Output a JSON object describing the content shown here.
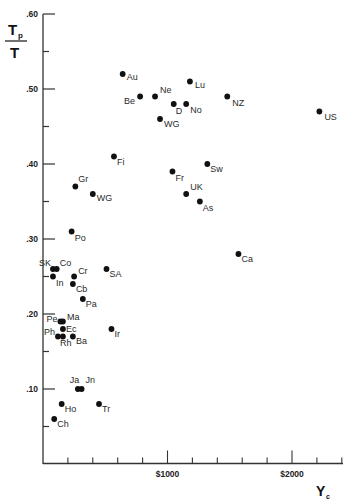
{
  "chart_data": {
    "type": "scatter",
    "title": "",
    "xlabel": "Y_c",
    "ylabel": "T_p / T",
    "xlim": [
      0,
      2400
    ],
    "ylim": [
      0.0,
      0.6
    ],
    "grid": false,
    "legend": "none",
    "y_ticks": [
      {
        "value": 0.6,
        "label": ".60"
      },
      {
        "value": 0.55,
        "label": ""
      },
      {
        "value": 0.5,
        "label": ".50"
      },
      {
        "value": 0.45,
        "label": ""
      },
      {
        "value": 0.4,
        "label": ".40"
      },
      {
        "value": 0.35,
        "label": ""
      },
      {
        "value": 0.3,
        "label": ".30"
      },
      {
        "value": 0.25,
        "label": ""
      },
      {
        "value": 0.2,
        "label": ".20"
      },
      {
        "value": 0.15,
        "label": ""
      },
      {
        "value": 0.1,
        "label": ".10"
      },
      {
        "value": 0.05,
        "label": ""
      }
    ],
    "x_ticks": [
      {
        "value": 200,
        "label": ""
      },
      {
        "value": 400,
        "label": ""
      },
      {
        "value": 600,
        "label": ""
      },
      {
        "value": 800,
        "label": ""
      },
      {
        "value": 1000,
        "label": "$1000",
        "major": true
      },
      {
        "value": 1200,
        "label": ""
      },
      {
        "value": 1400,
        "label": ""
      },
      {
        "value": 1600,
        "label": ""
      },
      {
        "value": 1800,
        "label": ""
      },
      {
        "value": 2000,
        "label": "$2000",
        "major": true
      },
      {
        "value": 2200,
        "label": ""
      },
      {
        "value": 2400,
        "label": ""
      }
    ],
    "points": [
      {
        "label": "Au",
        "x": 640,
        "y": 0.52,
        "dx": 4,
        "dy": 6
      },
      {
        "label": "Ne",
        "x": 900,
        "y": 0.49,
        "dx": 5,
        "dy": -4
      },
      {
        "label": "Be",
        "x": 780,
        "y": 0.49,
        "dx": -16,
        "dy": 7
      },
      {
        "label": "Lu",
        "x": 1180,
        "y": 0.51,
        "dx": 5,
        "dy": 6
      },
      {
        "label": "D",
        "x": 1050,
        "y": 0.48,
        "dx": 2,
        "dy": 10
      },
      {
        "label": "No",
        "x": 1150,
        "y": 0.48,
        "dx": 4,
        "dy": 9
      },
      {
        "label": "NZ",
        "x": 1480,
        "y": 0.49,
        "dx": 5,
        "dy": 9
      },
      {
        "label": "WG",
        "x": 940,
        "y": 0.46,
        "dx": 4,
        "dy": 8
      },
      {
        "label": "US",
        "x": 2220,
        "y": 0.47,
        "dx": 5,
        "dy": 8
      },
      {
        "label": "Fi",
        "x": 570,
        "y": 0.41,
        "dx": 3,
        "dy": 8
      },
      {
        "label": "Gr",
        "x": 260,
        "y": 0.37,
        "dx": 3,
        "dy": -5
      },
      {
        "label": "WG",
        "x": 400,
        "y": 0.36,
        "dx": 4,
        "dy": 7
      },
      {
        "label": "Sw",
        "x": 1320,
        "y": 0.4,
        "dx": 3,
        "dy": 8
      },
      {
        "label": "Fr",
        "x": 1040,
        "y": 0.39,
        "dx": 3,
        "dy": 9
      },
      {
        "label": "UK",
        "x": 1150,
        "y": 0.36,
        "dx": 4,
        "dy": -4
      },
      {
        "label": "As",
        "x": 1260,
        "y": 0.35,
        "dx": 3,
        "dy": 9
      },
      {
        "label": "Ca",
        "x": 1570,
        "y": 0.28,
        "dx": 3,
        "dy": 8
      },
      {
        "label": "Po",
        "x": 230,
        "y": 0.31,
        "dx": 3,
        "dy": 9
      },
      {
        "label": "SK",
        "x": 80,
        "y": 0.26,
        "dx": -14,
        "dy": -3
      },
      {
        "label": "Co",
        "x": 110,
        "y": 0.26,
        "dx": 3,
        "dy": -3
      },
      {
        "label": "In",
        "x": 80,
        "y": 0.25,
        "dx": 3,
        "dy": 9
      },
      {
        "label": "Cr",
        "x": 250,
        "y": 0.25,
        "dx": 4,
        "dy": -3
      },
      {
        "label": "SA",
        "x": 510,
        "y": 0.26,
        "dx": 3,
        "dy": 8
      },
      {
        "label": "Cb",
        "x": 240,
        "y": 0.24,
        "dx": 3,
        "dy": 8
      },
      {
        "label": "Pa",
        "x": 320,
        "y": 0.22,
        "dx": 3,
        "dy": 8
      },
      {
        "label": "Pe",
        "x": 140,
        "y": 0.19,
        "dx": -14,
        "dy": 0
      },
      {
        "label": "Ma",
        "x": 160,
        "y": 0.19,
        "dx": 4,
        "dy": -2
      },
      {
        "label": "Ec",
        "x": 160,
        "y": 0.18,
        "dx": 3,
        "dy": 3
      },
      {
        "label": "Ph",
        "x": 120,
        "y": 0.17,
        "dx": -14,
        "dy": -2
      },
      {
        "label": "Rh",
        "x": 160,
        "y": 0.17,
        "dx": -3,
        "dy": 9
      },
      {
        "label": "Ba",
        "x": 240,
        "y": 0.17,
        "dx": 3,
        "dy": 7
      },
      {
        "label": "Ir",
        "x": 550,
        "y": 0.18,
        "dx": 3,
        "dy": 8
      },
      {
        "label": "Ja",
        "x": 280,
        "y": 0.1,
        "dx": -8,
        "dy": -6
      },
      {
        "label": "Jn",
        "x": 310,
        "y": 0.1,
        "dx": 4,
        "dy": -6
      },
      {
        "label": "Ho",
        "x": 150,
        "y": 0.08,
        "dx": 3,
        "dy": 8
      },
      {
        "label": "Tr",
        "x": 450,
        "y": 0.08,
        "dx": 3,
        "dy": 8
      },
      {
        "label": "Ch",
        "x": 90,
        "y": 0.06,
        "dx": 3,
        "dy": 8
      }
    ]
  },
  "axes": {
    "y_title_numerator": "T",
    "y_title_subscript": "p",
    "y_title_denominator": "T",
    "x_title": "Y",
    "x_title_subscript": "c"
  }
}
